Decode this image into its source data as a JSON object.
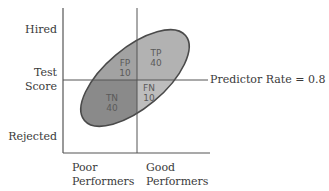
{
  "y_axis": {
    "top_label": "Hired",
    "middle_label_line1": "Test",
    "middle_label_line2": "Score",
    "bottom_label": "Rejected"
  },
  "x_axis": {
    "left_label_line1": "Poor",
    "left_label_line2": "Performers",
    "right_label_line1": "Good",
    "right_label_line2": "Performers"
  },
  "cutoff_line_label": "Predictor Rate = 0.8",
  "quadrants": {
    "fp": {
      "code": "FP",
      "value": "10"
    },
    "tp": {
      "code": "TP",
      "value": "40"
    },
    "tn": {
      "code": "TN",
      "value": "40"
    },
    "fn": {
      "code": "FN",
      "value": "10"
    }
  },
  "colors": {
    "dark_fill": "#8c8c8c",
    "light_fill": "#b4b4b4",
    "line": "#555555",
    "ellipse_stroke": "#4a4a4a"
  }
}
